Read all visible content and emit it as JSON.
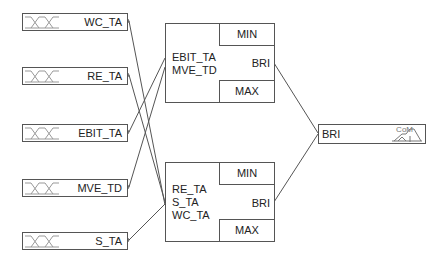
{
  "diagram": {
    "type": "fuzzy-logic-system",
    "inputs": [
      {
        "id": "wc_ta",
        "label": "WC_TA",
        "top": 13
      },
      {
        "id": "re_ta",
        "label": "RE_TA",
        "top": 67
      },
      {
        "id": "ebit_ta",
        "label": "EBIT_TA",
        "top": 124
      },
      {
        "id": "mve_td",
        "label": "MVE_TD",
        "top": 179
      },
      {
        "id": "s_ta",
        "label": "S_TA",
        "top": 232
      }
    ],
    "rule_blocks": [
      {
        "id": "rb1",
        "inputs": [
          "EBIT_TA",
          "MVE_TD"
        ],
        "aggregation": "MIN",
        "result_aggregation": "MAX",
        "output": "BRI"
      },
      {
        "id": "rb2",
        "inputs": [
          "RE_TA",
          "S_TA",
          "WC_TA"
        ],
        "aggregation": "MIN",
        "result_aggregation": "MAX",
        "output": "BRI"
      }
    ],
    "output": {
      "label": "BRI",
      "defuzzification": "CoM"
    },
    "connections": [
      {
        "from": "WC_TA",
        "to": "rb2"
      },
      {
        "from": "RE_TA",
        "to": "rb2"
      },
      {
        "from": "EBIT_TA",
        "to": "rb1"
      },
      {
        "from": "MVE_TD",
        "to": "rb1"
      },
      {
        "from": "S_TA",
        "to": "rb2"
      },
      {
        "from": "rb1",
        "to": "BRI"
      },
      {
        "from": "rb2",
        "to": "BRI"
      }
    ]
  }
}
